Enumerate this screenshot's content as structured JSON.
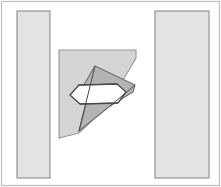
{
  "figure": {
    "canvas": {
      "width": 221,
      "height": 187,
      "background": "#ffffff"
    },
    "colors": {
      "page_background": "#ffffff",
      "band_fill": "#e3e3e3",
      "band_stroke": "#8c8c8c",
      "quadrant_fill": "#d5d5d5",
      "quadrant_stroke": "#9a9a9a",
      "wedge_fill": "#b4b4b4",
      "wedge_stroke": "#6e6e6e",
      "hexagon_fill": "#ffffff",
      "hexagon_stroke": "#4a4a4a",
      "frame_stroke": "#bdbdbd"
    },
    "frame": {
      "name": "outer-frame",
      "x": 1.5,
      "y": 1.5,
      "width": 218,
      "height": 184
    },
    "bands": [
      {
        "name": "left-band",
        "label": "left vertical band",
        "x": 17,
        "y": 11,
        "width": 33,
        "height": 167,
        "fill": "#e3e3e3",
        "stroke": "#8c8c8c"
      },
      {
        "name": "right-band",
        "label": "right vertical band",
        "x": 155,
        "y": 11,
        "width": 54,
        "height": 167,
        "fill": "#e3e3e3",
        "stroke": "#8c8c8c"
      }
    ],
    "quadrant": {
      "name": "quadrant-region",
      "label": "light gray quadrant with diagonal chamfer",
      "points": "59,50 136,50 136,58 120,85 98,115 79,133 59,138",
      "fill": "#d5d5d5",
      "stroke": "#9a9a9a"
    },
    "wedge": {
      "name": "wedge-region",
      "label": "darker gray wedge / cone",
      "points": "95,66 135,85 133,92 110,106 79,131 86,104 82,88",
      "fill": "#b4b4b4",
      "stroke": "#6e6e6e"
    },
    "hexagon": {
      "name": "hexagon-outline",
      "label": "elongated hexagonal outline",
      "points": "70,95 79,85 117,84 126,92 118,103 80,104",
      "fill": "#ffffff",
      "stroke": "#4a4a4a"
    },
    "guide_lines": [
      {
        "name": "guide-line-upper",
        "x1": 79,
        "y1": 85,
        "x2": 117,
        "y2": 84
      },
      {
        "name": "guide-line-lower",
        "x1": 80,
        "y1": 104,
        "x2": 118,
        "y2": 103
      },
      {
        "name": "guide-line-wedge-left",
        "x1": 95,
        "y1": 66,
        "x2": 79,
        "y2": 131
      },
      {
        "name": "guide-line-wedge-right",
        "x1": 135,
        "y1": 85,
        "x2": 110,
        "y2": 106
      }
    ]
  }
}
